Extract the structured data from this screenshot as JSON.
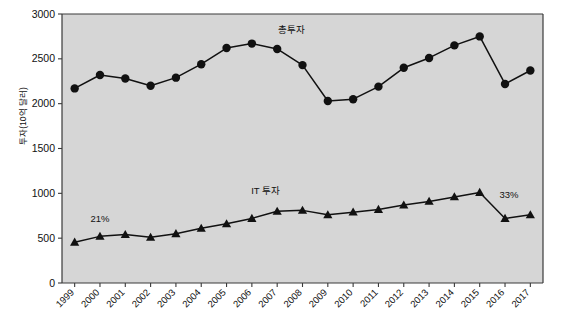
{
  "chart_data": {
    "type": "line",
    "title": "",
    "xlabel": "",
    "ylabel": "투자(10억 달러)",
    "ylim": [
      0,
      3000
    ],
    "yticks": [
      0,
      500,
      1000,
      1500,
      2000,
      2500,
      3000
    ],
    "grid": false,
    "legend_position": "inline-labels",
    "categories": [
      "1999",
      "2000",
      "2001",
      "2002",
      "2003",
      "2004",
      "2005",
      "2006",
      "2007",
      "2008",
      "2009",
      "2010",
      "2011",
      "2012",
      "2013",
      "2014",
      "2015",
      "2016",
      "2017"
    ],
    "series": [
      {
        "name": "총투자",
        "marker": "circle",
        "color": "#111111",
        "values": [
          2170,
          2320,
          2280,
          2200,
          2290,
          2440,
          2620,
          2670,
          2610,
          2430,
          2030,
          2050,
          2190,
          2400,
          2510,
          2650,
          2750,
          2220,
          2370
        ]
      },
      {
        "name": "IT 투자",
        "marker": "triangle",
        "color": "#111111",
        "values": [
          455,
          520,
          540,
          510,
          550,
          610,
          660,
          720,
          800,
          810,
          760,
          790,
          820,
          870,
          910,
          960,
          1010,
          720,
          760
        ]
      }
    ],
    "annotations": [
      {
        "text": "21%",
        "category": "2000",
        "value": 680
      },
      {
        "text": "33%",
        "category": "2016",
        "value": 950
      }
    ]
  },
  "axes": {
    "y_tick_labels": [
      "3000",
      "2500",
      "2000",
      "1500",
      "1000",
      "500",
      "0"
    ],
    "x_tick_labels": [
      "1999",
      "2000",
      "2001",
      "2002",
      "2003",
      "2004",
      "2005",
      "2006",
      "2007",
      "2008",
      "2009",
      "2010",
      "2011",
      "2012",
      "2013",
      "2014",
      "2015",
      "2016",
      "2017"
    ],
    "y_axis_title": "투자(10억 달러)"
  },
  "series_labels": {
    "total": "총투자",
    "it": "IT 투자"
  },
  "annotation_labels": {
    "left": "21%",
    "right": "33%"
  },
  "colors": {
    "plot_background": "#d6d6d6",
    "plot_border": "#3a3a3a",
    "line": "#111111",
    "page_background": "#ffffff"
  }
}
